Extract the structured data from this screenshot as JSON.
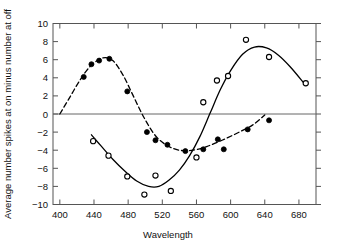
{
  "chart_data": {
    "type": "scatter",
    "title": "",
    "subtitle": "",
    "xlabel": "Wavelength",
    "ylabel": "Average number spikes at on minus number at off",
    "xlim": [
      392,
      700
    ],
    "ylim": [
      -10,
      10
    ],
    "xticks": [
      400,
      440,
      480,
      520,
      560,
      600,
      640,
      680
    ],
    "yticks": [
      -10,
      -8,
      -6,
      -4,
      -2,
      0,
      2,
      4,
      6,
      8,
      10
    ],
    "xtick_labels": [
      "400",
      "440",
      "480",
      "520",
      "560",
      "600",
      "640",
      "680"
    ],
    "ytick_labels": [
      "-10",
      "-8",
      "-6",
      "-4",
      "-2",
      "0",
      "2",
      "4",
      "6",
      "8",
      "10"
    ],
    "grid": false,
    "legend": "none",
    "zero_line": true,
    "series": [
      {
        "name": "filled-circles",
        "marker": "filled-circle",
        "line_style": "dashed",
        "color": "#000000",
        "points": [
          {
            "x": 428,
            "y": 4.1
          },
          {
            "x": 437,
            "y": 5.5
          },
          {
            "x": 446,
            "y": 5.9
          },
          {
            "x": 458,
            "y": 6.1
          },
          {
            "x": 479,
            "y": 2.5
          },
          {
            "x": 502,
            "y": -2.0
          },
          {
            "x": 512,
            "y": -2.9
          },
          {
            "x": 526,
            "y": -3.4
          },
          {
            "x": 547,
            "y": -4.1
          },
          {
            "x": 568,
            "y": -3.9
          },
          {
            "x": 585,
            "y": -2.8
          },
          {
            "x": 592,
            "y": -3.9
          },
          {
            "x": 620,
            "y": -1.7
          },
          {
            "x": 645,
            "y": -0.7
          }
        ],
        "curve": [
          {
            "x": 400,
            "y": 0.0
          },
          {
            "x": 412,
            "y": 1.9
          },
          {
            "x": 424,
            "y": 3.8
          },
          {
            "x": 436,
            "y": 5.3
          },
          {
            "x": 450,
            "y": 6.2
          },
          {
            "x": 462,
            "y": 5.9
          },
          {
            "x": 474,
            "y": 4.3
          },
          {
            "x": 486,
            "y": 2.0
          },
          {
            "x": 498,
            "y": -0.3
          },
          {
            "x": 512,
            "y": -2.4
          },
          {
            "x": 526,
            "y": -3.5
          },
          {
            "x": 540,
            "y": -4.0
          },
          {
            "x": 556,
            "y": -4.0
          },
          {
            "x": 572,
            "y": -3.6
          },
          {
            "x": 590,
            "y": -2.9
          },
          {
            "x": 608,
            "y": -2.1
          },
          {
            "x": 626,
            "y": -1.2
          },
          {
            "x": 640,
            "y": -0.1
          }
        ]
      },
      {
        "name": "open-circles",
        "marker": "open-circle",
        "line_style": "solid",
        "color": "#000000",
        "points": [
          {
            "x": 439,
            "y": -3.0
          },
          {
            "x": 457,
            "y": -4.6
          },
          {
            "x": 479,
            "y": -6.9
          },
          {
            "x": 499,
            "y": -8.9
          },
          {
            "x": 512,
            "y": -6.8
          },
          {
            "x": 530,
            "y": -8.5
          },
          {
            "x": 560,
            "y": -4.8
          },
          {
            "x": 568,
            "y": 1.3
          },
          {
            "x": 584,
            "y": 3.7
          },
          {
            "x": 597,
            "y": 4.2
          },
          {
            "x": 618,
            "y": 8.2
          },
          {
            "x": 645,
            "y": 6.3
          },
          {
            "x": 688,
            "y": 3.4
          }
        ],
        "curve": [
          {
            "x": 437,
            "y": -2.3
          },
          {
            "x": 448,
            "y": -3.5
          },
          {
            "x": 462,
            "y": -5.0
          },
          {
            "x": 476,
            "y": -6.3
          },
          {
            "x": 490,
            "y": -7.4
          },
          {
            "x": 504,
            "y": -8.0
          },
          {
            "x": 516,
            "y": -8.0
          },
          {
            "x": 528,
            "y": -7.3
          },
          {
            "x": 540,
            "y": -6.2
          },
          {
            "x": 552,
            "y": -4.6
          },
          {
            "x": 564,
            "y": -2.5
          },
          {
            "x": 576,
            "y": 0.1
          },
          {
            "x": 588,
            "y": 2.7
          },
          {
            "x": 600,
            "y": 4.8
          },
          {
            "x": 614,
            "y": 6.6
          },
          {
            "x": 628,
            "y": 7.4
          },
          {
            "x": 642,
            "y": 7.3
          },
          {
            "x": 656,
            "y": 6.5
          },
          {
            "x": 670,
            "y": 5.2
          },
          {
            "x": 686,
            "y": 3.4
          }
        ]
      }
    ]
  }
}
